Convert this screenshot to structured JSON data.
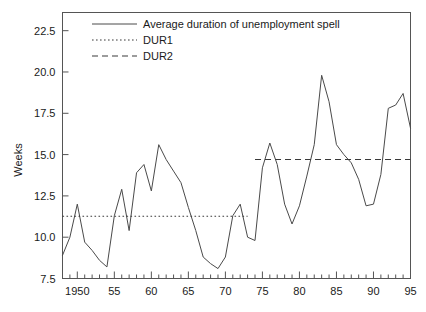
{
  "chart_data": {
    "type": "line",
    "title": "",
    "xlabel": "",
    "ylabel": "Weeks",
    "xlim": [
      1948,
      1995
    ],
    "ylim": [
      7.5,
      23.6
    ],
    "grid": false,
    "legend_position": "top-center",
    "y_ticks": [
      "7.5",
      "10.0",
      "12.5",
      "15.0",
      "17.5",
      "20.0",
      "22.5"
    ],
    "y_tick_values": [
      7.5,
      10.0,
      12.5,
      15.0,
      17.5,
      20.0,
      22.5
    ],
    "x_ticks": [
      "1950",
      "55",
      "60",
      "65",
      "70",
      "75",
      "80",
      "85",
      "90",
      "95"
    ],
    "x_tick_values": [
      1950,
      1955,
      1960,
      1965,
      1970,
      1975,
      1980,
      1985,
      1990,
      1995
    ],
    "x_minor_step": 1,
    "series": [
      {
        "name": "Average duration of unemployment spell",
        "style": "solid",
        "x": [
          1948,
          1949,
          1950,
          1951,
          1952,
          1953,
          1954,
          1955,
          1956,
          1957,
          1958,
          1959,
          1960,
          1961,
          1962,
          1963,
          1964,
          1965,
          1966,
          1967,
          1968,
          1969,
          1970,
          1971,
          1972,
          1973,
          1974,
          1975,
          1976,
          1977,
          1978,
          1979,
          1980,
          1981,
          1982,
          1983,
          1984,
          1985,
          1986,
          1987,
          1988,
          1989,
          1990,
          1991,
          1992,
          1993,
          1994,
          1995
        ],
        "values": [
          8.9,
          10.0,
          12.0,
          9.7,
          9.2,
          8.6,
          8.2,
          11.3,
          12.9,
          10.4,
          13.9,
          14.4,
          12.8,
          15.6,
          14.7,
          14.0,
          13.3,
          11.8,
          10.4,
          8.8,
          8.4,
          8.1,
          8.8,
          11.3,
          12.0,
          10.0,
          9.8,
          14.2,
          15.7,
          14.4,
          12.0,
          10.8,
          11.9,
          13.7,
          15.6,
          19.8,
          18.2,
          15.6,
          15.0,
          14.5,
          13.5,
          11.9,
          12.0,
          13.8,
          17.8,
          18.0,
          18.7,
          16.6
        ]
      },
      {
        "name": "DUR1",
        "style": "dotted",
        "level": 11.27,
        "x_start": 1948,
        "x_end": 1973
      },
      {
        "name": "DUR2",
        "style": "dashed",
        "level": 14.7,
        "x_start": 1974,
        "x_end": 1995
      }
    ],
    "legend_entries": [
      {
        "label": "Average duration of unemployment spell",
        "style": "solid"
      },
      {
        "label": "DUR1",
        "style": "dotted"
      },
      {
        "label": "DUR2",
        "style": "dashed"
      }
    ],
    "colors": {
      "series_line": "#4a4a4a",
      "dur_line": "#3a3a3a",
      "axis": "#555555",
      "text": "#1a1a1a",
      "background": "#ffffff"
    }
  }
}
